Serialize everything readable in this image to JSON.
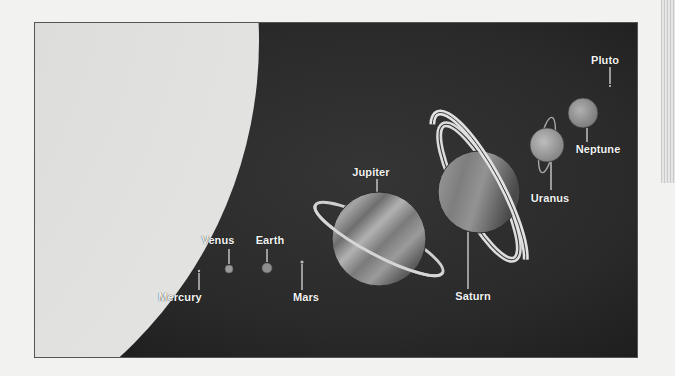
{
  "figure": {
    "background_color": "#2a2a2a",
    "sun": {
      "name": "Sun",
      "color": "#d9d9d7",
      "shade_color": "#bdbdbb"
    },
    "label_color": "#f4f4f4",
    "planets": [
      {
        "name": "Mercury",
        "cx": 198,
        "cy": 270,
        "r": 1,
        "color": "#bbbbbb",
        "label_x": 180,
        "label_y": 292,
        "leader": [
          198,
          272,
          198,
          289
        ]
      },
      {
        "name": "Venus",
        "cx": 228,
        "cy": 268,
        "r": 4,
        "color": "#9a9a9a",
        "label_x": 218,
        "label_y": 235,
        "leader": [
          228,
          248,
          228,
          263
        ]
      },
      {
        "name": "Earth",
        "cx": 265,
        "cy": 267,
        "r": 5,
        "color": "#8e8e8e",
        "label_x": 270,
        "label_y": 235,
        "leader": [
          266,
          248,
          266,
          261
        ]
      },
      {
        "name": "Mars",
        "cx": 301,
        "cy": 261,
        "r": 1.5,
        "color": "#bbbbbb",
        "label_x": 306,
        "label_y": 292,
        "leader": [
          301,
          263,
          301,
          289
        ]
      },
      {
        "name": "Jupiter",
        "cx": 378,
        "cy": 238,
        "r": 47,
        "color": "#8a8a8a",
        "label_x": 370,
        "label_y": 167,
        "leader": [
          376,
          178,
          376,
          191
        ]
      },
      {
        "name": "Saturn",
        "cx": 478,
        "cy": 191,
        "r": 41,
        "color": "#8f8f8f",
        "label_x": 473,
        "label_y": 291,
        "leader": [
          467,
          228,
          467,
          288
        ]
      },
      {
        "name": "Uranus",
        "cx": 546,
        "cy": 144,
        "r": 17,
        "color": "#a5a5a5",
        "label_x": 550,
        "label_y": 193,
        "leader": [
          550,
          161,
          550,
          189
        ]
      },
      {
        "name": "Neptune",
        "cx": 582,
        "cy": 112,
        "r": 15,
        "color": "#9d9d9d",
        "label_x": 598,
        "label_y": 144,
        "leader": [
          586,
          127,
          586,
          141
        ]
      },
      {
        "name": "Pluto",
        "cx": 609,
        "cy": 85,
        "r": 1,
        "color": "#cccccc",
        "label_x": 605,
        "label_y": 55,
        "leader": [
          609,
          66,
          609,
          83
        ]
      }
    ]
  }
}
